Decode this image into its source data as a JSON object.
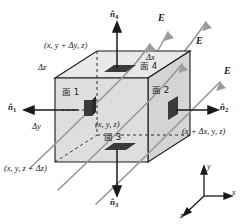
{
  "figure": {
    "type": "physics-diagram",
    "background": "#ffffff",
    "box": {
      "fill_front": "#dcdcdc",
      "fill_top": "#e6e6e6",
      "fill_side": "#d2d2d2",
      "stroke": "#1a1a1a",
      "hidden_stroke_dash": "3,3"
    },
    "field": {
      "color": "#9a9a9a",
      "label": "E",
      "line_count": 5,
      "arrow_count": 3
    },
    "patch_color": "#3a3a3a"
  },
  "labels": {
    "corner_top_back": "(x, y + Δy, z)",
    "corner_bottom_left_front": "(x, y, z + Δz)",
    "corner_center": "(x, y, z)",
    "corner_right": "(x + Δx, y, z)",
    "delta_z": "Δz",
    "delta_y": "Δy",
    "delta_x": "Δx"
  },
  "faces": [
    {
      "id": "face-1",
      "label": "面 1"
    },
    {
      "id": "face-2",
      "label": "面 2"
    },
    {
      "id": "face-3",
      "label": "面 3"
    },
    {
      "id": "face-4",
      "label": "面 4"
    }
  ],
  "normals": [
    {
      "id": "n1",
      "symbol": "n",
      "subscript": "1",
      "direction": "left"
    },
    {
      "id": "n2",
      "symbol": "n",
      "subscript": "2",
      "direction": "right"
    },
    {
      "id": "n3",
      "symbol": "n",
      "subscript": "3",
      "direction": "down"
    },
    {
      "id": "n4",
      "symbol": "n",
      "subscript": "4",
      "direction": "up"
    }
  ],
  "field_labels": [
    {
      "id": "E-top",
      "text": "E"
    },
    {
      "id": "E-middle",
      "text": "E"
    },
    {
      "id": "E-bottom",
      "text": "E"
    }
  ],
  "axes": {
    "x_label": "x",
    "y_label": "y",
    "z_label": "z",
    "color": "#1a1a1a"
  }
}
